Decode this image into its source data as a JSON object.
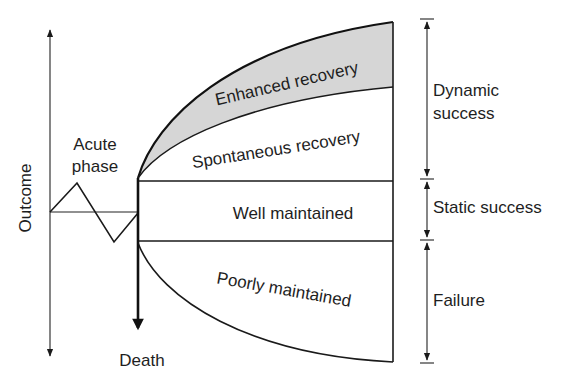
{
  "diagram": {
    "axis_label": "Outcome",
    "acute_phase": {
      "line1": "Acute",
      "line2": "phase"
    },
    "death_label": "Death",
    "regions": {
      "enhanced": "Enhanced recovery",
      "spontaneous": "Spontaneous recovery",
      "well_maintained": "Well maintained",
      "poorly_maintained": "Poorly maintained"
    },
    "brackets": {
      "dynamic": {
        "line1": "Dynamic",
        "line2": "success"
      },
      "static": "Static success",
      "failure": "Failure"
    },
    "colors": {
      "shading": "#d6d6d6",
      "ink": "#1e1e1e",
      "background": "#ffffff"
    }
  }
}
